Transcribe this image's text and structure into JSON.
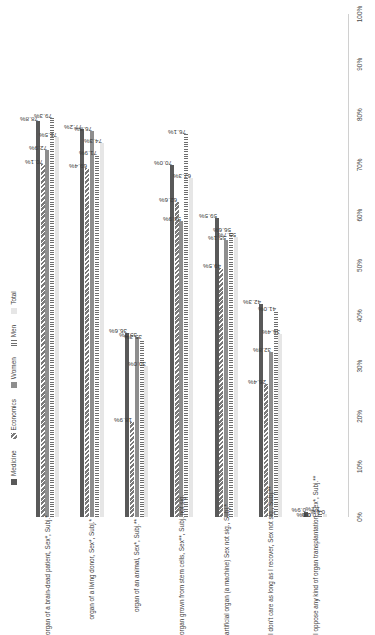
{
  "chart_data": {
    "type": "bar",
    "orientation": "horizontal",
    "title": "",
    "xlabel": "",
    "ylabel": "",
    "xlim": [
      0,
      100
    ],
    "grid": false,
    "legend_position": "top",
    "xticks": [
      "0%",
      "10%",
      "20%",
      "30%",
      "40%",
      "50%",
      "60%",
      "70%",
      "80%",
      "90%",
      "100%"
    ],
    "xtick_values": [
      0,
      10,
      20,
      30,
      40,
      50,
      60,
      70,
      80,
      90,
      100
    ],
    "categories": [
      "organ of a brain-dead patient, Sex*, Subj.*",
      "organ of a living donor, Sex*, Subj.*",
      "organ of an animal, Sex*, Subj.**",
      "organ grown from stem cells, Sex**, Subj. not sig.",
      "artificial organ (a machine) Sex not sig., Subj.*",
      "I don't care as long as I recover, Sex not sig., Subj.**",
      "I oppose any kind of organ transplantation, Sex*, Subj.**"
    ],
    "series": [
      {
        "name": "Medicine",
        "color": "#595959",
        "pattern": "solid",
        "values": [
          78.8,
          77.2,
          36.6,
          70.0,
          59.5,
          42.3,
          0.9
        ],
        "labels": [
          "78.8%",
          "77.2%",
          "36.6%",
          "70.0%",
          "59.5%",
          "42.3%",
          "0.9%"
        ]
      },
      {
        "name": "Economics",
        "color": "#7a7a7a",
        "pattern": "diagonal-hatch",
        "values": [
          70.1,
          69.4,
          18.9,
          62.6,
          49.5,
          26.4,
          0.0
        ],
        "labels": [
          "70.1%",
          "69.4%",
          "18.9%",
          "62.6%",
          "49.5%",
          "26.4%",
          "0.0%"
        ]
      },
      {
        "name": "Women",
        "color": "#8e8e8e",
        "pattern": "solid",
        "values": [
          72.9,
          76.8,
          35.7,
          58.9,
          55.1,
          32.8,
          0.0
        ],
        "labels": [
          "72.9%",
          "76.8%",
          "35.7%",
          "58.9%",
          "55.1%",
          "32.8%",
          "0.0%"
        ]
      },
      {
        "name": "Men",
        "color": "#6e6e6e",
        "pattern": "vertical-lines",
        "values": [
          79.3,
          71.9,
          35.3,
          76.1,
          56.6,
          41.0,
          1.2
        ],
        "labels": [
          "79.3%",
          "71.9%",
          "35.3%",
          "76.1%",
          "56.6%",
          "41.0%",
          "1.2%"
        ]
      },
      {
        "name": "Total",
        "color": "#e6e6e6",
        "pattern": "solid",
        "values": [
          75.5,
          74.3,
          30.0,
          67.3,
          55.7,
          36.4,
          0.6
        ],
        "labels": [
          "75.5%",
          "74.3%",
          "30.0%",
          "67.3%",
          "55.7%",
          "36.4%",
          "0.6%"
        ]
      }
    ]
  },
  "legend": {
    "items": [
      {
        "label": "Medicine"
      },
      {
        "label": "Economics"
      },
      {
        "label": "Women"
      },
      {
        "label": "Men"
      },
      {
        "label": "Total"
      }
    ]
  }
}
